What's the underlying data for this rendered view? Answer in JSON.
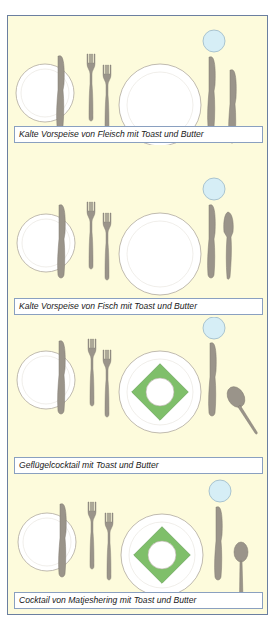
{
  "colors": {
    "background": "#fdfbdc",
    "frame_border": "#6b7fa0",
    "caption_border": "#8aa0c0",
    "cutlery": "#9a948a",
    "glass": "#d6eef6",
    "napkin": "#7fbf6a",
    "plate_edge": "#b0a9a0"
  },
  "settings": [
    {
      "caption": "Kalte Vorspeise von Fleisch mit Toast und Butter",
      "items": [
        "bread-plate",
        "butter-knife",
        "small-fork",
        "fork",
        "dinner-plate",
        "knife",
        "small-knife",
        "glass"
      ]
    },
    {
      "caption": "Kalte Vorspeise von Fisch mit Toast und Butter",
      "items": [
        "bread-plate",
        "butter-knife",
        "small-fork",
        "fork",
        "dinner-plate",
        "knife",
        "fish-knife",
        "glass"
      ]
    },
    {
      "caption": "Geflügelcocktail mit Toast und Butter",
      "items": [
        "bread-plate",
        "butter-knife",
        "small-fork",
        "fork",
        "dinner-plate-with-napkin",
        "knife",
        "spoon",
        "glass"
      ]
    },
    {
      "caption": "Cocktail von Matjeshering mit Toast und Butter",
      "items": [
        "bread-plate",
        "butter-knife",
        "small-fork",
        "fork",
        "dinner-plate-with-napkin",
        "knife",
        "teaspoon",
        "glass"
      ]
    }
  ]
}
